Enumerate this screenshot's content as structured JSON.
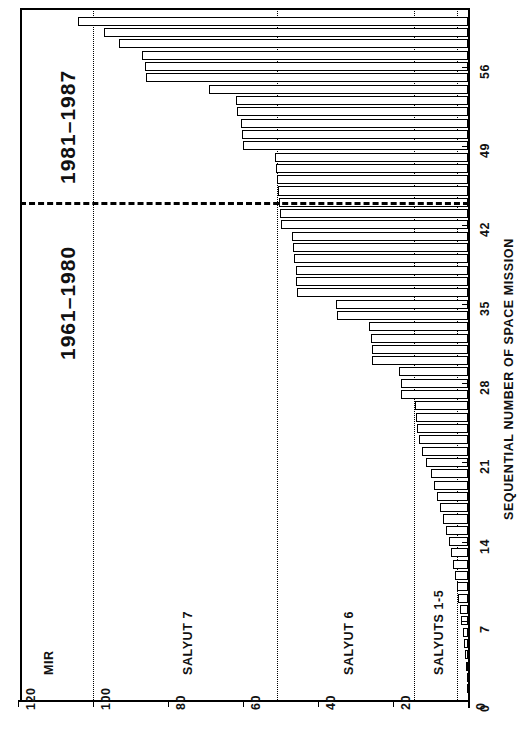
{
  "chart_data": {
    "type": "bar",
    "orientation": "horizontal",
    "title": "",
    "xlabel": "",
    "ylabel": "SEQUENTIAL NUMBER OF SPACE MISSION",
    "xlim": [
      0,
      125
    ],
    "ylim": [
      0,
      61
    ],
    "grid": false,
    "xticks": [
      0,
      20,
      40,
      60,
      80,
      100,
      120
    ],
    "xticklabels": [
      "0",
      "20",
      "40",
      "60",
      "80",
      "100",
      "120"
    ],
    "yticks": [
      0,
      7,
      14,
      21,
      28,
      35,
      42,
      49,
      56
    ],
    "yticklabels": [
      "0",
      "7",
      "14",
      "21",
      "28",
      "35",
      "42",
      "49",
      "56"
    ],
    "categories": [
      1,
      2,
      3,
      4,
      5,
      6,
      7,
      8,
      9,
      10,
      11,
      12,
      13,
      14,
      15,
      16,
      17,
      18,
      19,
      20,
      21,
      22,
      23,
      24,
      25,
      26,
      27,
      28,
      29,
      30,
      31,
      32,
      33,
      34,
      35,
      36,
      37,
      38,
      39,
      40,
      41,
      42,
      43,
      44,
      45,
      46,
      47,
      48,
      49,
      50,
      51,
      52,
      53,
      54,
      55,
      56,
      57,
      58,
      59,
      60
    ],
    "values": [
      0.1,
      0.3,
      0.5,
      0.8,
      1.1,
      1.4,
      1.8,
      2.2,
      2.6,
      3.0,
      3.5,
      4.0,
      4.6,
      5.2,
      5.9,
      6.6,
      7.4,
      8.2,
      9.0,
      10.0,
      11.2,
      12.4,
      13.1,
      13.5,
      13.8,
      14.2,
      17.8,
      18.0,
      18.4,
      25.5,
      25.7,
      26.0,
      26.4,
      35.0,
      35.2,
      45.5,
      45.8,
      46.0,
      46.3,
      46.6,
      47.0,
      50.0,
      50.2,
      50.4,
      50.6,
      51.0,
      51.3,
      51.6,
      60.0,
      60.3,
      60.6,
      61.5,
      62.0,
      69.0,
      86.0,
      86.3,
      87.0,
      93.0,
      97.0,
      104.0
    ],
    "max_value": 120,
    "max_value_index": 60,
    "vertical_reference_lines": [
      3,
      14.5,
      51,
      100
    ],
    "era_divider_y": 44,
    "stations": [
      {
        "name": "SALYUTS 1-5",
        "axis_pos": 8
      },
      {
        "name": "SALYUT 6",
        "axis_pos": 32
      },
      {
        "name": "SALYUT 7",
        "axis_pos": 75
      },
      {
        "name": "MIR",
        "axis_pos": 112
      }
    ],
    "eras": [
      {
        "label": "1961–1980",
        "position": "below-divider"
      },
      {
        "label": "1981–1987",
        "position": "above-divider"
      }
    ]
  },
  "axes": {
    "y_axis_title": "SEQUENTIAL NUMBER OF SPACE MISSION"
  }
}
